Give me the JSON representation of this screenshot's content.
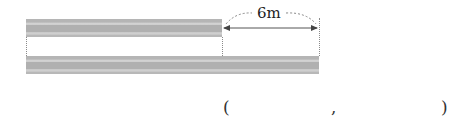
{
  "diagram": {
    "top_bar": {
      "label": "shorter bar",
      "x_start": 26,
      "x_end": 222
    },
    "bottom_bar": {
      "label": "longer bar",
      "x_start": 26,
      "x_end": 319
    },
    "difference_label": "6m",
    "colors": {
      "bar": "#b5b5b5",
      "line": "#8a8a8a"
    }
  },
  "answer": {
    "open_paren": "(",
    "separator": ",",
    "close_paren": ")"
  }
}
